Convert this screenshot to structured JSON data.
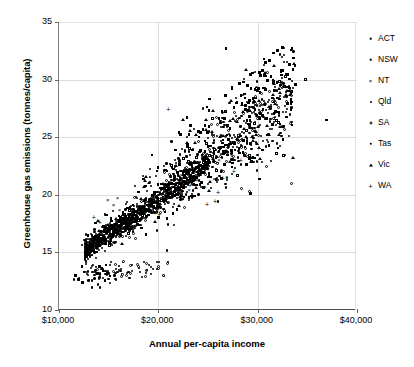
{
  "chart_data": {
    "type": "scatter",
    "title": "",
    "xlabel": "Annual per-capita income",
    "ylabel": "Greenhouse gas emissions (tonnes/capita)",
    "xlim": [
      10000,
      40000
    ],
    "ylim": [
      10,
      35
    ],
    "xticks": [
      10000,
      20000,
      30000,
      40000
    ],
    "xticklabels": [
      "$10,000",
      "$20,000",
      "$30,000",
      "$40,000"
    ],
    "yticks": [
      10,
      15,
      20,
      25,
      30,
      35
    ],
    "yticklabels": [
      "10",
      "15",
      "20",
      "25",
      "30",
      "35"
    ],
    "grid": "horizontal and vertical light-gray gridlines at tick positions",
    "legend_position": "right, outside plot area, no border",
    "series": [
      {
        "name": "ACT",
        "marker": "filled-square",
        "color": "#000000",
        "points": [
          [
            24900,
            23.1
          ],
          [
            25600,
            23.6
          ],
          [
            26200,
            24.0
          ],
          [
            27100,
            24.4
          ],
          [
            28000,
            25.2
          ],
          [
            29200,
            26.1
          ],
          [
            30300,
            27.0
          ],
          [
            31500,
            28.4
          ],
          [
            32700,
            29.4
          ],
          [
            33800,
            29.6
          ],
          [
            23800,
            22.4
          ],
          [
            22900,
            21.8
          ],
          [
            26800,
            32.7
          ],
          [
            29800,
            28.4
          ],
          [
            27600,
            27.6
          ],
          [
            24100,
            25.0
          ],
          [
            21700,
            23.9
          ],
          [
            25100,
            21.9
          ],
          [
            28600,
            24.7
          ],
          [
            30900,
            26.6
          ]
        ]
      },
      {
        "name": "NSW",
        "marker": "open-square",
        "color": "#000000",
        "points": [
          [
            17800,
            17.9
          ],
          [
            18400,
            18.2
          ],
          [
            19100,
            18.6
          ],
          [
            19900,
            19.0
          ],
          [
            20700,
            19.5
          ],
          [
            21400,
            20.1
          ],
          [
            22100,
            20.6
          ],
          [
            22800,
            21.0
          ],
          [
            23600,
            21.6
          ],
          [
            24300,
            22.1
          ],
          [
            25000,
            22.6
          ],
          [
            25800,
            23.2
          ],
          [
            26500,
            23.8
          ],
          [
            27300,
            24.4
          ],
          [
            28100,
            25.0
          ],
          [
            28900,
            25.6
          ],
          [
            29700,
            26.2
          ],
          [
            30500,
            26.9
          ],
          [
            31300,
            27.6
          ],
          [
            32200,
            28.3
          ],
          [
            33100,
            29.0
          ],
          [
            34800,
            30.0
          ],
          [
            36900,
            26.5
          ],
          [
            31900,
            23.6
          ],
          [
            29400,
            22.9
          ]
        ]
      },
      {
        "name": "NT",
        "marker": "x-cross",
        "color": "#000000",
        "points": [
          [
            14900,
            19.5
          ],
          [
            15500,
            19.1
          ],
          [
            16100,
            18.6
          ],
          [
            22300,
            21.7
          ],
          [
            24100,
            22.5
          ],
          [
            25000,
            22.2
          ],
          [
            26100,
            23.0
          ],
          [
            25600,
            21.3
          ],
          [
            26900,
            21.5
          ],
          [
            24700,
            20.6
          ],
          [
            23100,
            20.4
          ],
          [
            27400,
            23.3
          ],
          [
            15900,
            19.7
          ],
          [
            21500,
            20.9
          ],
          [
            23900,
            21.2
          ]
        ]
      },
      {
        "name": "Qld",
        "marker": "dot",
        "color": "#000000",
        "points": [
          [
            13100,
            15.5
          ],
          [
            13800,
            15.7
          ],
          [
            14400,
            15.9
          ],
          [
            15100,
            16.2
          ],
          [
            15800,
            16.5
          ],
          [
            16500,
            16.8
          ],
          [
            17200,
            17.2
          ],
          [
            17900,
            17.6
          ],
          [
            18600,
            18.0
          ],
          [
            19300,
            18.4
          ],
          [
            20000,
            18.8
          ],
          [
            20700,
            19.2
          ],
          [
            21400,
            19.7
          ],
          [
            22100,
            20.2
          ],
          [
            22800,
            20.7
          ],
          [
            23500,
            21.2
          ],
          [
            24200,
            21.8
          ],
          [
            24900,
            22.3
          ],
          [
            25600,
            22.9
          ],
          [
            26300,
            23.5
          ],
          [
            27000,
            24.1
          ]
        ]
      },
      {
        "name": "SA",
        "marker": "open-circle",
        "color": "#000000",
        "points": [
          [
            16400,
            16.4
          ],
          [
            17500,
            17.1
          ],
          [
            18700,
            17.8
          ],
          [
            19800,
            18.5
          ],
          [
            21000,
            19.3
          ],
          [
            22200,
            20.1
          ],
          [
            23400,
            21.0
          ],
          [
            24600,
            21.9
          ],
          [
            25800,
            22.8
          ],
          [
            27000,
            23.7
          ],
          [
            28300,
            24.7
          ],
          [
            29500,
            25.6
          ],
          [
            30800,
            26.6
          ],
          [
            32100,
            27.6
          ],
          [
            33400,
            28.6
          ],
          [
            24000,
            24.6
          ],
          [
            26400,
            22.1
          ],
          [
            29000,
            23.3
          ],
          [
            20300,
            20.0
          ],
          [
            22600,
            18.9
          ]
        ]
      },
      {
        "name": "Tas",
        "marker": "filled-circle",
        "color": "#000000",
        "points": [
          [
            12600,
            15.3
          ],
          [
            13200,
            15.5
          ],
          [
            13900,
            15.8
          ],
          [
            14600,
            16.0
          ],
          [
            15300,
            16.3
          ],
          [
            16000,
            16.6
          ],
          [
            16700,
            16.9
          ],
          [
            17400,
            17.3
          ],
          [
            18100,
            17.7
          ],
          [
            18800,
            18.1
          ],
          [
            19500,
            18.5
          ],
          [
            20200,
            18.9
          ],
          [
            20900,
            19.4
          ],
          [
            21600,
            19.9
          ],
          [
            22300,
            20.4
          ],
          [
            23000,
            20.9
          ],
          [
            23700,
            21.4
          ],
          [
            15000,
            13.2
          ],
          [
            15600,
            13.0
          ],
          [
            16200,
            13.4
          ],
          [
            14700,
            13.1
          ],
          [
            17000,
            13.3
          ]
        ]
      },
      {
        "name": "Vic",
        "marker": "triangle",
        "color": "#000000",
        "points": [
          [
            19600,
            18.9
          ],
          [
            20800,
            19.6
          ],
          [
            22000,
            20.4
          ],
          [
            23200,
            21.2
          ],
          [
            24400,
            22.0
          ],
          [
            25600,
            22.9
          ],
          [
            26800,
            23.8
          ],
          [
            28000,
            24.8
          ],
          [
            29200,
            25.8
          ],
          [
            30400,
            26.8
          ],
          [
            31700,
            27.9
          ],
          [
            33000,
            29.0
          ],
          [
            24800,
            25.6
          ],
          [
            27200,
            26.4
          ],
          [
            21300,
            21.0
          ],
          [
            25200,
            21.1
          ],
          [
            29900,
            24.4
          ]
        ]
      },
      {
        "name": "WA",
        "marker": "plus",
        "color": "#000000",
        "points": [
          [
            13500,
            18.0
          ],
          [
            14100,
            17.6
          ],
          [
            21000,
            27.4
          ],
          [
            26500,
            21.4
          ],
          [
            27600,
            22.0
          ],
          [
            24900,
            19.2
          ],
          [
            25700,
            19.4
          ],
          [
            23200,
            20.8
          ],
          [
            19400,
            19.0
          ],
          [
            22400,
            19.6
          ],
          [
            16800,
            17.4
          ],
          [
            28300,
            23.0
          ],
          [
            20100,
            18.3
          ],
          [
            26000,
            20.2
          ]
        ]
      }
    ],
    "cloud_description": "Dense positively-correlated band of ~900 small black markers rising from about ($12,500, 15) to ($33,000, 29), with a detached lower sub-cluster near ($15,000, 13) and sparse high outliers up to 32.7 tonnes/capita."
  },
  "axis": {
    "ytitle": "Greenhouse gas emissions (tonnes/capita)",
    "xtitle": "Annual per-capita income"
  },
  "legend": {
    "items": [
      {
        "label": "ACT",
        "marker": "filled-square-icon"
      },
      {
        "label": "NSW",
        "marker": "open-square-icon"
      },
      {
        "label": "NT",
        "marker": "x-cross-icon"
      },
      {
        "label": "Qld",
        "marker": "dot-icon"
      },
      {
        "label": "SA",
        "marker": "open-circle-icon"
      },
      {
        "label": "Tas",
        "marker": "filled-circle-icon"
      },
      {
        "label": "Vic",
        "marker": "triangle-icon"
      },
      {
        "label": "WA",
        "marker": "plus-icon"
      }
    ]
  }
}
